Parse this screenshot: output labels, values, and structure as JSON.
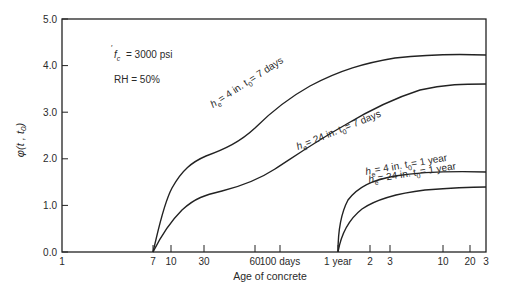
{
  "chart_data": {
    "type": "line",
    "title": "",
    "xlabel": "Age of concrete",
    "ylabel": "φ(t, t0)",
    "xscale": "log",
    "ylim": [
      0.0,
      5.0
    ],
    "y_ticks": [
      "0.0",
      "1.0",
      "2.0",
      "3.0",
      "4.0",
      "5.0"
    ],
    "x_ticks": [
      "1",
      "7",
      "10",
      "30",
      "60",
      "100 days",
      "1 year",
      "2",
      "3",
      "10",
      "20",
      "3"
    ],
    "annotations": [
      "f'c = 3000 psi",
      "RH = 50%"
    ],
    "series": [
      {
        "name": "he = 4 in. t0 = 7 days",
        "x_days": [
          7,
          10,
          30,
          60,
          100,
          365,
          1095,
          3650,
          10950
        ],
        "values": [
          0.0,
          1.2,
          2.0,
          2.6,
          3.2,
          4.1,
          4.6,
          4.8,
          4.85
        ]
      },
      {
        "name": "he = 24 in. t0 = 7 days",
        "x_days": [
          7,
          10,
          30,
          60,
          100,
          365,
          1095,
          3650,
          10950
        ],
        "values": [
          0.0,
          0.7,
          1.2,
          1.45,
          1.75,
          2.6,
          3.2,
          3.55,
          3.6
        ]
      },
      {
        "name": "he = 4 in. t0 = 1 year",
        "x_days": [
          365,
          380,
          730,
          1095,
          3650,
          10950
        ],
        "values": [
          0.0,
          1.0,
          1.6,
          1.9,
          2.2,
          2.3
        ]
      },
      {
        "name": "he = 24 in. t0 = 1 year",
        "x_days": [
          365,
          380,
          730,
          1095,
          3650,
          10950
        ],
        "values": [
          0.0,
          0.5,
          1.1,
          1.4,
          1.6,
          1.7
        ]
      }
    ]
  },
  "labels": {
    "fc": "= 3000 psi",
    "rh": "RH = 50%",
    "xlabel": "Age of concrete",
    "s1": "= 4 in.   t",
    "s1b": "= 7 days",
    "s2": "= 24 in.   t",
    "s2b": "= 7 days",
    "s3": "= 4 in.   t",
    "s3b": "= 1 year",
    "s4": "= 24 in.   t",
    "s4b": "= 1 year"
  }
}
